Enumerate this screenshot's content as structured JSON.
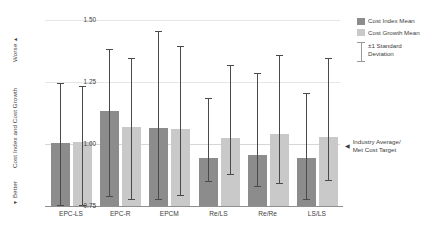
{
  "chart_data": {
    "type": "bar",
    "title": "",
    "xlabel": "",
    "ylabel": "Cost Index and Cost Growth",
    "ylim": [
      0.75,
      1.5
    ],
    "yticks": [
      "1.50",
      "1.25",
      "1.00",
      "0.75"
    ],
    "ytick_values": [
      1.5,
      1.25,
      1.0,
      0.75
    ],
    "grid": true,
    "legend_position": "right",
    "categories": [
      "EPC-LS",
      "EPC-R",
      "EPCM",
      "Re/LS",
      "Re/Re",
      "LS/LS"
    ],
    "series": [
      {
        "name": "Cost Index Mean",
        "color": "#8c8c8c",
        "values": [
          1.005,
          1.135,
          1.065,
          0.945,
          0.955,
          0.945
        ],
        "error_low": [
          0.745,
          0.785,
          0.775,
          0.845,
          0.825,
          0.775
        ],
        "error_high": [
          1.245,
          1.385,
          1.455,
          1.185,
          1.285,
          1.205
        ]
      },
      {
        "name": "Cost Growth Mean",
        "color": "#c9c9c9",
        "values": [
          1.01,
          1.07,
          1.06,
          1.025,
          1.04,
          1.03
        ],
        "error_low": [
          0.735,
          0.775,
          0.79,
          0.875,
          0.84,
          0.85
        ],
        "error_high": [
          1.235,
          1.345,
          1.395,
          1.32,
          1.36,
          1.345
        ]
      }
    ],
    "reference_line": {
      "value": 1.0,
      "label_line1": "Industry Average/",
      "label_line2": "Met Cost Target",
      "arrow": "◀"
    },
    "axis_direction": {
      "worse": "Worse",
      "worse_arrow": "▲",
      "better": "Better",
      "better_arrow": "▼"
    },
    "error_legend": {
      "label_line1": "±1 Standard",
      "label_line2": "Deviation"
    }
  }
}
